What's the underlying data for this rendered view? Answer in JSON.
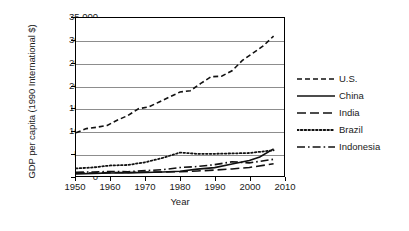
{
  "chart_data": {
    "type": "line",
    "title": "",
    "xlabel": "Year",
    "ylabel": "GDP per capita (1990 International $)",
    "xlim": [
      1950,
      2010
    ],
    "ylim": [
      0,
      35000
    ],
    "xticks": [
      1950,
      1960,
      1970,
      1980,
      1990,
      2000,
      2010
    ],
    "xtick_labels": [
      "1950",
      "1960",
      "1970",
      "1980",
      "1990",
      "2000",
      "2010"
    ],
    "yticks": [
      0,
      5000,
      10000,
      15000,
      20000,
      25000,
      30000,
      35000
    ],
    "ytick_labels": [
      "0",
      "5,000",
      "10,000",
      "15,000",
      "20,000",
      "25,000",
      "30,000",
      "35,000"
    ],
    "grid": "horizontal",
    "legend_position": "right-outside",
    "series": [
      {
        "name": "U.S.",
        "style": "dashed",
        "dasharray": "5,3",
        "width": 1.6,
        "x": [
          1950,
          1953,
          1956,
          1959,
          1962,
          1965,
          1968,
          1971,
          1974,
          1977,
          1980,
          1983,
          1986,
          1989,
          1992,
          1995,
          1998,
          2001,
          2004,
          2007
        ],
        "values": [
          9561,
          10500,
          10800,
          11200,
          12400,
          13400,
          14900,
          15300,
          16400,
          17500,
          18600,
          18900,
          20500,
          22000,
          22100,
          23300,
          25600,
          27200,
          28800,
          31000
        ]
      },
      {
        "name": "China",
        "style": "solid",
        "dasharray": "none",
        "width": 1.6,
        "x": [
          1950,
          1955,
          1960,
          1965,
          1970,
          1975,
          1980,
          1985,
          1990,
          1995,
          2000,
          2003,
          2007
        ],
        "values": [
          448,
          575,
          662,
          700,
          778,
          900,
          1067,
          1522,
          1858,
          2653,
          3421,
          4200,
          6000
        ]
      },
      {
        "name": "India",
        "style": "long-dash",
        "dasharray": "9,4",
        "width": 1.6,
        "x": [
          1950,
          1955,
          1960,
          1965,
          1970,
          1975,
          1980,
          1985,
          1990,
          1995,
          2000,
          2007
        ],
        "values": [
          619,
          676,
          753,
          785,
          868,
          900,
          938,
          1106,
          1309,
          1568,
          1892,
          2700
        ]
      },
      {
        "name": "Brazil",
        "style": "dotted",
        "dasharray": "1.6,2.2",
        "width": 1.8,
        "x": [
          1950,
          1955,
          1960,
          1965,
          1970,
          1975,
          1980,
          1985,
          1990,
          1995,
          2000,
          2007
        ],
        "values": [
          1672,
          1900,
          2335,
          2450,
          3057,
          4000,
          5198,
          4900,
          4920,
          5000,
          5100,
          5700
        ]
      },
      {
        "name": "Indonesia",
        "style": "dash-dot",
        "dasharray": "8,3,1.6,3",
        "width": 1.6,
        "x": [
          1950,
          1955,
          1960,
          1965,
          1970,
          1975,
          1980,
          1985,
          1990,
          1995,
          2000,
          2007
        ],
        "values": [
          840,
          900,
          1000,
          950,
          1194,
          1400,
          1870,
          2100,
          2514,
          3150,
          2900,
          3700
        ]
      }
    ]
  },
  "legend": {
    "items": [
      {
        "label": "U.S."
      },
      {
        "label": "China"
      },
      {
        "label": "India"
      },
      {
        "label": "Brazil"
      },
      {
        "label": "Indonesia"
      }
    ]
  }
}
